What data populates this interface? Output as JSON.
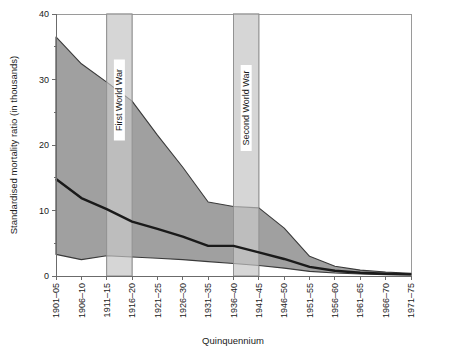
{
  "chart_data": {
    "type": "area",
    "title": "",
    "xlabel": "Quinquennium",
    "ylabel": "Standardised mortality ratio (in thousands)",
    "ylim": [
      0,
      40
    ],
    "yticks": [
      0,
      10,
      20,
      30,
      40
    ],
    "yminorticks": [
      5,
      15,
      25,
      35
    ],
    "grid": false,
    "legend_position": "none",
    "categories": [
      "1901–05",
      "1906–10",
      "1911–15",
      "1916–20",
      "1921–25",
      "1926–30",
      "1931–35",
      "1936–40",
      "1941–45",
      "1946–50",
      "1951–55",
      "1956–60",
      "1961–65",
      "1966–70",
      "1971–75"
    ],
    "series": [
      {
        "name": "Upper bound",
        "values": [
          36.5,
          32.4,
          29.6,
          26.7,
          21.5,
          16.6,
          11.3,
          10.6,
          10.4,
          7.3,
          3.0,
          1.5,
          0.9,
          0.6,
          0.4
        ]
      },
      {
        "name": "Median",
        "values": [
          14.8,
          11.9,
          10.2,
          8.3,
          7.2,
          6.0,
          4.6,
          4.6,
          3.6,
          2.6,
          1.4,
          0.8,
          0.5,
          0.35,
          0.25
        ]
      },
      {
        "name": "Lower bound",
        "values": [
          3.3,
          2.5,
          3.1,
          2.9,
          2.7,
          2.5,
          2.2,
          1.9,
          1.6,
          1.2,
          0.7,
          0.45,
          0.3,
          0.2,
          0.15
        ]
      }
    ],
    "annotations": [
      {
        "label": "First World War",
        "start_category": "1911–15",
        "end_category": "1916–20"
      },
      {
        "label": "Second World War",
        "start_category": "1936–40",
        "end_category": "1941–45"
      }
    ],
    "colors": {
      "band_fill": "#a0a0a0",
      "band_outline": "#3a3a3a",
      "median_line": "#1a1a1a",
      "war_band_fill": "#cfcfcf",
      "axis": "#6b6b6b",
      "text": "#1a1a1a"
    }
  }
}
